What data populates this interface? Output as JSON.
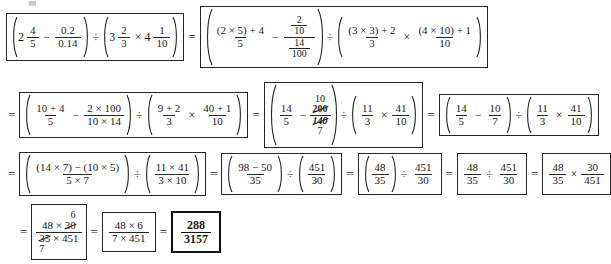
{
  "document": {
    "type": "handwritten-math-worksheet",
    "title": "Step-by-step simplification of a mixed-number expression",
    "final_answer": "288/3157",
    "symbols": {
      "equals": "=",
      "divide": "÷",
      "times": "×",
      "minus": "−",
      "plus": "+"
    }
  },
  "rows": [
    {
      "id": "row-1",
      "steps": [
        {
          "id": "step-1-original",
          "boxed": true,
          "label": "original-expression",
          "terms": {
            "left_mixed_whole": "2",
            "left_mixed_num": "4",
            "left_mixed_den": "5",
            "decimal_num": "0.2",
            "decimal_den": "0.14",
            "right_mixed1_whole": "3",
            "right_mixed1_num": "2",
            "right_mixed1_den": "3",
            "right_mixed2_whole": "4",
            "right_mixed2_num": "1",
            "right_mixed2_den": "10"
          }
        },
        {
          "id": "step-2-improper",
          "boxed": true,
          "label": "convert-to-improper-fractions",
          "terms": {
            "a_num": "(2 × 5) + 4",
            "a_den": "5",
            "b_top_num": "2",
            "b_top_den": "10",
            "b_bot_num": "14",
            "b_bot_den": "100",
            "c_num": "(3 × 3) + 2",
            "c_den": "3",
            "d_num": "(4 × 10) + 1",
            "d_den": "10"
          }
        }
      ]
    },
    {
      "id": "row-2",
      "steps": [
        {
          "id": "step-3-evaluate",
          "boxed": true,
          "label": "evaluate-products",
          "terms": {
            "a_num": "10 + 4",
            "a_den": "5",
            "b_num": "2 × 100",
            "b_den": "10 × 14",
            "c_num": "9 + 2",
            "c_den": "3",
            "d_num": "40 + 1",
            "d_den": "10"
          }
        },
        {
          "id": "step-4-cancel",
          "boxed": true,
          "label": "cancel-common-factors",
          "terms": {
            "a_num": "14",
            "a_den": "5",
            "b_above": "10",
            "b_num_cancelled": "200",
            "b_den_cancelled": "140",
            "b_below": "7",
            "c_num": "11",
            "c_den": "3",
            "d_num": "41",
            "d_den": "10"
          }
        },
        {
          "id": "step-5-reduced",
          "boxed": true,
          "label": "reduced-fractions",
          "terms": {
            "a_num": "14",
            "a_den": "5",
            "b_num": "10",
            "b_den": "7",
            "c_num": "11",
            "c_den": "3",
            "d_num": "41",
            "d_den": "10"
          }
        }
      ]
    },
    {
      "id": "row-3",
      "steps": [
        {
          "id": "step-6-common-denominator",
          "boxed": true,
          "label": "common-denominator",
          "terms": {
            "a_num": "(14 × 7) − (10 × 5)",
            "a_den": "5 × 7",
            "b_num": "11 × 41",
            "b_den": "3 × 10"
          }
        },
        {
          "id": "step-7-products",
          "boxed": true,
          "label": "compute-products",
          "terms": {
            "a_num": "98 − 50",
            "a_den": "35",
            "b_num": "451",
            "b_den": "30"
          }
        },
        {
          "id": "step-8-subtracted",
          "boxed": true,
          "label": "subtraction-result",
          "terms": {
            "a_num": "48",
            "a_den": "35",
            "b_num": "451",
            "b_den": "30"
          }
        },
        {
          "id": "step-9-division",
          "boxed": true,
          "label": "division-of-fractions",
          "terms": {
            "a_num": "48",
            "a_den": "35",
            "b_num": "451",
            "b_den": "30"
          }
        },
        {
          "id": "step-10-reciprocal",
          "boxed": true,
          "label": "multiply-by-reciprocal",
          "terms": {
            "a_num": "48",
            "a_den": "35",
            "b_num": "30",
            "b_den": "451"
          }
        }
      ]
    },
    {
      "id": "row-4",
      "steps": [
        {
          "id": "step-11-cancel2",
          "boxed": true,
          "label": "cancel-30-and-35",
          "terms": {
            "above": "6",
            "num_left": "48 × ",
            "num_cancelled": "30",
            "den_cancelled": "35",
            "den_right": " × 451",
            "below": "7"
          }
        },
        {
          "id": "step-12-simplified",
          "boxed": true,
          "label": "simplified-product",
          "terms": {
            "num": "48 × 6",
            "den": "7 × 451"
          }
        },
        {
          "id": "step-13-answer",
          "boxed": true,
          "heavy": true,
          "label": "final-answer",
          "terms": {
            "num": "288",
            "den": "3157"
          }
        }
      ]
    }
  ]
}
